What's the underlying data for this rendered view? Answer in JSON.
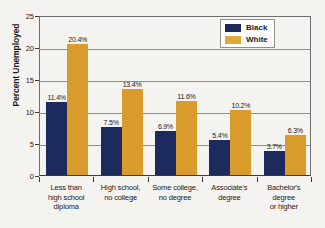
{
  "chart_data": {
    "type": "bar",
    "title": "",
    "xlabel": "",
    "ylabel": "Percent Unemployed",
    "ylim": [
      0,
      25
    ],
    "yticks": [
      "0",
      "5",
      "10",
      "15",
      "20",
      "25"
    ],
    "grid": true,
    "legend_position": "top-right",
    "categories": [
      "Less than high school diploma",
      "High school, no college",
      "Some college, no degree",
      "Associate's degree",
      "Bachelor's degree or higher"
    ],
    "category_lines": [
      [
        "Less than",
        "high school",
        "diploma"
      ],
      [
        "High school,",
        "no college"
      ],
      [
        "Some college,",
        "no degree"
      ],
      [
        "Associate's",
        "degree"
      ],
      [
        "Bachelor's",
        "degree",
        "or higher"
      ]
    ],
    "series": [
      {
        "name": "Black",
        "color": "#1c2a5e",
        "values": [
          11.4,
          7.5,
          6.9,
          5.4,
          3.7
        ],
        "labels": [
          "11.4%",
          "7.5%",
          "6.9%",
          "5.4%",
          "3.7%"
        ]
      },
      {
        "name": "White",
        "color": "#d99b2b",
        "values": [
          20.4,
          13.4,
          11.6,
          10.2,
          6.3
        ],
        "labels": [
          "20.4%",
          "13.4%",
          "11.6%",
          "10.2%",
          "6.3%"
        ]
      }
    ]
  },
  "legend": {
    "items": [
      {
        "label": "Black",
        "swatch": "legend-swatch-black"
      },
      {
        "label": "White",
        "swatch": "legend-swatch-white"
      }
    ]
  },
  "colors": {
    "black_series": "#1c2a5e",
    "white_series": "#d99b2b",
    "background": "#f5f3ef",
    "gridline": "#8e8e8e",
    "axis": "#3b3b3b"
  }
}
